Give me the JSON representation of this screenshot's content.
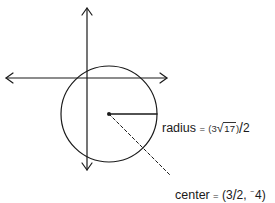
{
  "diagram": {
    "type": "circle-on-coordinate-axes",
    "colors": {
      "stroke": "#1a1a1a",
      "background": "#ffffff"
    },
    "axes": {
      "horizontal": {
        "x1": 6,
        "x2": 167,
        "y": 78,
        "arrows": "both"
      },
      "vertical": {
        "x": 87,
        "y1": 8,
        "y2": 170,
        "arrows": "both"
      }
    },
    "circle": {
      "cx": 109,
      "cy": 114,
      "r": 48
    },
    "radius_segment": {
      "x1": 109,
      "y1": 114,
      "x2": 157,
      "y2": 114
    },
    "center_leader": {
      "x1": 109,
      "y1": 114,
      "x2": 170,
      "y2": 175,
      "style": "dashed"
    }
  },
  "labels": {
    "radius": {
      "word": "radius",
      "equals": "=",
      "open": "(3",
      "radical": "√",
      "radicand": "17",
      "close": ")",
      "slash": "/",
      "denominator": "2",
      "full_text": "radius = (3√17)/2"
    },
    "center": {
      "word": "center",
      "equals": "=",
      "open": "(3",
      "slash": "/",
      "x_denominator": "2",
      "comma": ",",
      "neg_sign": "−",
      "y_value": "4",
      "close": ")",
      "full_text": "center = (3/2, −4)"
    }
  }
}
